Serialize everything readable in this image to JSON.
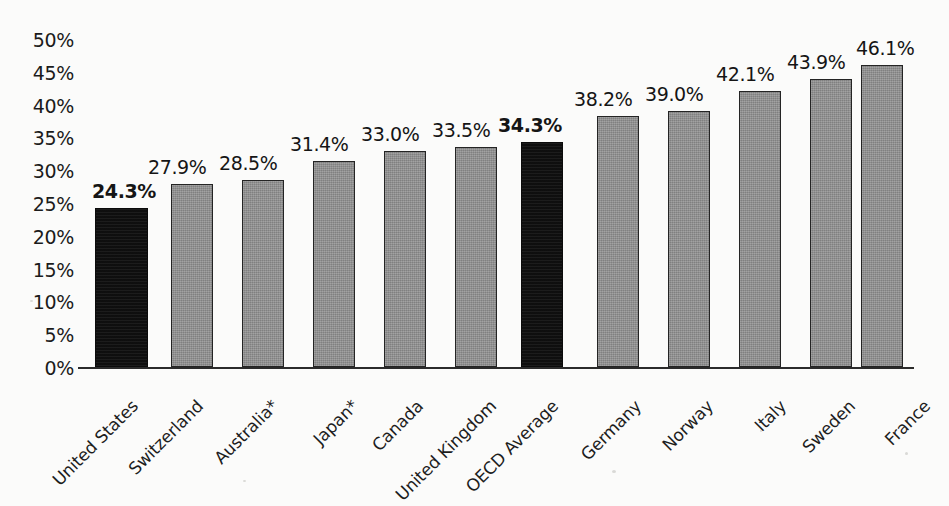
{
  "chart_data": {
    "type": "bar",
    "title": "",
    "subtitle": "",
    "xlabel": "",
    "ylabel": "",
    "ylim": [
      0,
      50
    ],
    "ytick_labels": [
      "50%",
      "45%",
      "40%",
      "35%",
      "30%",
      "25%",
      "20%",
      "15%",
      "10%",
      "5%",
      "0%"
    ],
    "ytick_values": [
      50,
      45,
      40,
      35,
      30,
      25,
      20,
      15,
      10,
      5,
      0
    ],
    "grid": false,
    "legend": false,
    "categories": [
      "United States",
      "Switzerland",
      "Australia*",
      "Japan*",
      "Canada",
      "United Kingdom",
      "OECD Average",
      "Germany",
      "Norway",
      "Italy",
      "Sweden",
      "France"
    ],
    "values": [
      24.3,
      27.9,
      28.5,
      31.4,
      33.0,
      33.5,
      34.3,
      38.2,
      39.0,
      42.1,
      43.9,
      46.1
    ],
    "data_labels": [
      "24.3%",
      "27.9%",
      "28.5%",
      "31.4%",
      "33.0%",
      "33.5%",
      "34.3%",
      "38.2%",
      "39.0%",
      "42.1%",
      "43.9%",
      "46.1%"
    ],
    "highlighted": [
      true,
      false,
      false,
      false,
      false,
      false,
      true,
      false,
      false,
      false,
      false,
      false
    ],
    "bold_labels": [
      true,
      false,
      false,
      false,
      false,
      false,
      true,
      false,
      false,
      false,
      false,
      false
    ],
    "colors": {
      "bar_default": "#8d8d8d",
      "bar_highlight": "#121212",
      "bar_border": "#242424",
      "axis": "#2b2b2b",
      "text": "#1b1b1b",
      "background": "#fbfbfa"
    }
  }
}
